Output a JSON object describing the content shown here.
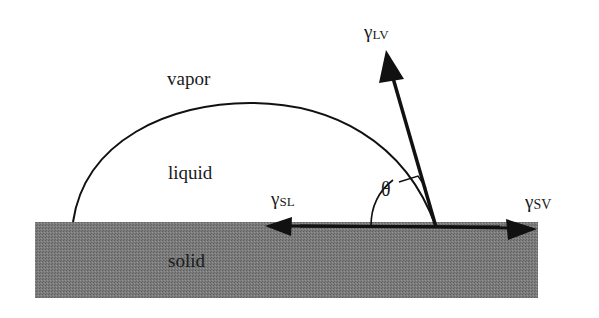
{
  "diagram": {
    "regions": {
      "vapor": "vapor",
      "liquid": "liquid",
      "solid": "solid"
    },
    "vectors": {
      "liquid_vapor": {
        "symbol": "γ",
        "subscript": "LV"
      },
      "solid_liquid": {
        "symbol": "γ",
        "subscript": "SL"
      },
      "solid_vapor": {
        "symbol": "γ",
        "subscript": "SV"
      }
    },
    "angle": {
      "symbol": "θ"
    },
    "colors": {
      "background": "#ffffff",
      "solid_fill": "#7a7a7a",
      "line": "#111111",
      "text": "#1a1a1a"
    }
  }
}
